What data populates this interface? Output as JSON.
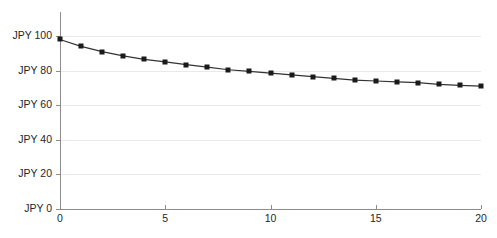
{
  "chart_data": {
    "type": "line",
    "title": "",
    "subtitle": "",
    "xlabel": "",
    "ylabel": "",
    "xlim": [
      0,
      20
    ],
    "ylim": [
      0,
      100
    ],
    "grid": true,
    "legend": null,
    "currency_prefix": "JPY",
    "marker": "square",
    "marker_color": "#1a1a1a",
    "line_color": "#333333",
    "gridline_color": "#e9e9e9",
    "axis_color": "#8c8c8c",
    "x_tick_labels": [
      "0",
      "5",
      "10",
      "15",
      "20"
    ],
    "x_ticks": [
      0,
      5,
      10,
      15,
      20
    ],
    "y_tick_labels": [
      "JPY 0",
      "JPY 20",
      "JPY 40",
      "JPY 60",
      "JPY 80",
      "JPY 100"
    ],
    "y_ticks": [
      0,
      20,
      40,
      60,
      80,
      100
    ],
    "x": [
      0,
      1,
      2,
      3,
      4,
      5,
      6,
      7,
      8,
      9,
      10,
      11,
      12,
      13,
      14,
      15,
      16,
      17,
      18,
      19,
      20
    ],
    "values": [
      98,
      94,
      91,
      88.5,
      86.5,
      85,
      83.5,
      82,
      80.5,
      79.5,
      78.5,
      77.5,
      76.5,
      75.5,
      74.5,
      74,
      73.5,
      73,
      72,
      71.5,
      71
    ],
    "series": [
      {
        "name": "JPY value",
        "values": [
          98,
          94,
          91,
          88.5,
          86.5,
          85,
          83.5,
          82,
          80.5,
          79.5,
          78.5,
          77.5,
          76.5,
          75.5,
          74.5,
          74,
          73.5,
          73,
          72,
          71.5,
          71
        ]
      }
    ]
  }
}
